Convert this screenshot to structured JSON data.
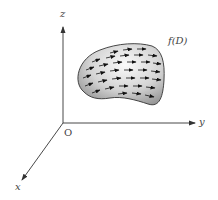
{
  "figure": {
    "axes": {
      "z_label": "z",
      "y_label": "y",
      "x_label": "x",
      "origin_label": "O"
    },
    "surface": {
      "label": "f(D)",
      "fill_light": "#f2f2f2",
      "fill_dark": "#9a9a9a",
      "outline": "#333333",
      "arrow_color": "#1a1a1a",
      "arrow_rows": 7,
      "arrow_direction": "right"
    },
    "colors": {
      "axis": "#333333",
      "background": "#ffffff"
    }
  }
}
